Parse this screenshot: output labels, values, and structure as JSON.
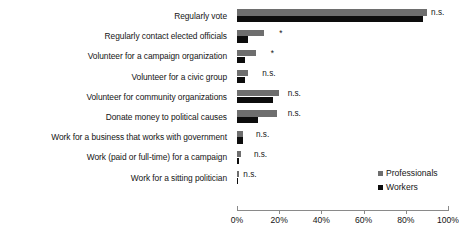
{
  "chart_data": {
    "type": "bar",
    "orientation": "horizontal",
    "title": "",
    "xlabel": "",
    "ylabel": "",
    "xlim": [
      0,
      100
    ],
    "xticks": [
      "0%",
      "20%",
      "40%",
      "60%",
      "80%",
      "100%"
    ],
    "xtick_values": [
      0,
      20,
      40,
      60,
      80,
      100
    ],
    "grid": false,
    "legend_position": "inside-right",
    "categories": [
      "Regularly vote",
      "Regularly contact elected officials",
      "Volunteer for a campaign organization",
      "Volunteer for a civic group",
      "Volunteer for community organizations",
      "Donate money to political causes",
      "Work for a business that works with government",
      "Work (paid or full-time) for a campaign",
      "Work for a sitting politician"
    ],
    "series": [
      {
        "name": "Professionals",
        "color": "#6e6e6e",
        "values": [
          90,
          13,
          9,
          5,
          20,
          19,
          3,
          2,
          1
        ]
      },
      {
        "name": "Workers",
        "color": "#0d0d0d",
        "values": [
          88,
          5,
          4,
          4,
          17,
          10,
          3,
          1,
          0
        ]
      }
    ],
    "annotations": [
      "n.s.",
      "*",
      "*",
      "n.s.",
      "n.s.",
      "n.s.",
      "n.s.",
      "n.s.",
      "n.s."
    ],
    "annotation_offsets_pct": [
      92,
      20,
      16,
      12,
      24,
      24,
      9,
      8,
      3
    ]
  },
  "legend": {
    "items": [
      {
        "label": "Professionals",
        "color": "#6e6e6e"
      },
      {
        "label": "Workers",
        "color": "#0d0d0d"
      }
    ]
  }
}
